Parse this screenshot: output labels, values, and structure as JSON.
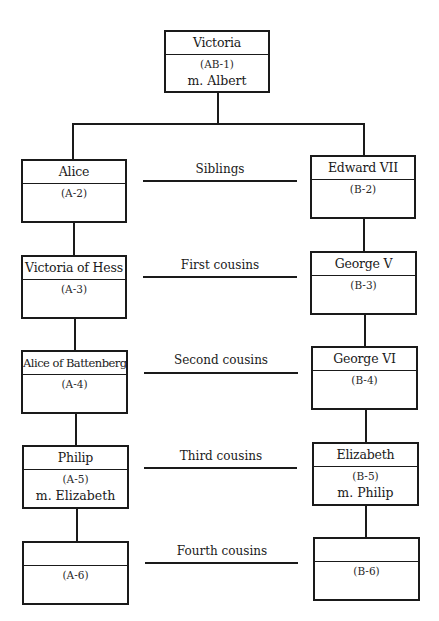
{
  "diagram": {
    "type": "family-tree",
    "root": {
      "name": "Victoria",
      "code": "(AB-1)",
      "spouse": "m. Albert"
    },
    "left_line": [
      {
        "name": "Alice",
        "code": "(A-2)",
        "spouse": ""
      },
      {
        "name": "Victoria of Hess",
        "code": "(A-3)",
        "spouse": ""
      },
      {
        "name": "Alice of Battenberg",
        "code": "(A-4)",
        "spouse": ""
      },
      {
        "name": "Philip",
        "code": "(A-5)",
        "spouse": "m. Elizabeth"
      },
      {
        "name": "",
        "code": "(A-6)",
        "spouse": ""
      }
    ],
    "right_line": [
      {
        "name": "Edward VII",
        "code": "(B-2)",
        "spouse": ""
      },
      {
        "name": "George V",
        "code": "(B-3)",
        "spouse": ""
      },
      {
        "name": "George VI",
        "code": "(B-4)",
        "spouse": ""
      },
      {
        "name": "Elizabeth",
        "code": "(B-5)",
        "spouse": "m. Philip"
      },
      {
        "name": "",
        "code": "(B-6)",
        "spouse": ""
      }
    ],
    "relationships": [
      "Siblings",
      "First cousins",
      "Second cousins",
      "Third cousins",
      "Fourth cousins"
    ]
  }
}
